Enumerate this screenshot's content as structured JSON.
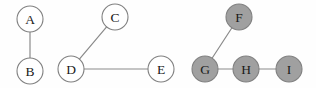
{
  "figure": {
    "background_color": "#fefefe"
  },
  "style": {
    "node_radius": 13,
    "node_fill_unshaded": "#ffffff",
    "node_fill_shaded": "#a0a0a0",
    "node_stroke": "#808080",
    "edge_color": "#8a8a8a",
    "label_color": "#1a1a1a"
  },
  "chart_data": {
    "type": "diagram",
    "subtype": "node-link-graph",
    "directed": false,
    "nodes": [
      {
        "id": "A",
        "label": "A",
        "x": 30,
        "y": 19,
        "r": 13,
        "shaded": false,
        "component": 1
      },
      {
        "id": "B",
        "label": "B",
        "x": 30,
        "y": 71,
        "r": 13,
        "shaded": false,
        "component": 1
      },
      {
        "id": "C",
        "label": "C",
        "x": 115,
        "y": 17,
        "r": 13,
        "shaded": false,
        "component": 2
      },
      {
        "id": "D",
        "label": "D",
        "x": 71,
        "y": 69,
        "r": 13,
        "shaded": false,
        "component": 2
      },
      {
        "id": "E",
        "label": "E",
        "x": 161,
        "y": 69,
        "r": 13,
        "shaded": false,
        "component": 2
      },
      {
        "id": "F",
        "label": "F",
        "x": 239,
        "y": 17,
        "r": 13,
        "shaded": true,
        "component": 3
      },
      {
        "id": "G",
        "label": "G",
        "x": 205,
        "y": 69,
        "r": 13,
        "shaded": true,
        "component": 3
      },
      {
        "id": "H",
        "label": "H",
        "x": 246,
        "y": 69,
        "r": 13,
        "shaded": true,
        "component": 3
      },
      {
        "id": "I",
        "label": "I",
        "x": 289,
        "y": 69,
        "r": 13,
        "shaded": true,
        "component": 3
      }
    ],
    "edges": [
      {
        "source": "A",
        "target": "B"
      },
      {
        "source": "C",
        "target": "D"
      },
      {
        "source": "D",
        "target": "E"
      },
      {
        "source": "F",
        "target": "G"
      },
      {
        "source": "G",
        "target": "H"
      },
      {
        "source": "H",
        "target": "I"
      }
    ],
    "components": [
      {
        "index": 1,
        "members": [
          "A",
          "B"
        ],
        "shaded": false
      },
      {
        "index": 2,
        "members": [
          "C",
          "D",
          "E"
        ],
        "shaded": false
      },
      {
        "index": 3,
        "members": [
          "F",
          "G",
          "H",
          "I"
        ],
        "shaded": true
      }
    ]
  }
}
